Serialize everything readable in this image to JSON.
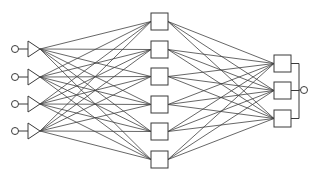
{
  "diagram": {
    "type": "neural-network",
    "background": "#ffffff",
    "stroke_color": "#3a3a3a",
    "edge_color": "#404040",
    "layers": {
      "input": {
        "count": 4,
        "node_shape": "circle-with-triangle",
        "circle_x": 15,
        "circle_r": 3.5,
        "triangle_base_x": 28,
        "triangle_apex_x": 40,
        "triangle_half_height": 8,
        "y": [
          49,
          77,
          104,
          131
        ]
      },
      "hidden": {
        "count": 6,
        "node_shape": "square",
        "x": 151,
        "size": 17,
        "y": [
          13,
          41,
          68,
          96,
          123,
          151
        ]
      },
      "output": {
        "count": 3,
        "node_shape": "square",
        "x": 274,
        "size": 17,
        "y": [
          55,
          82,
          110
        ]
      }
    },
    "combiner": {
      "bracket_x": 299,
      "circle_x": 303,
      "circle_y": 90,
      "circle_r": 3.5
    },
    "connections": {
      "input_to_hidden": "fully-connected",
      "hidden_to_output": "fully-connected"
    }
  }
}
